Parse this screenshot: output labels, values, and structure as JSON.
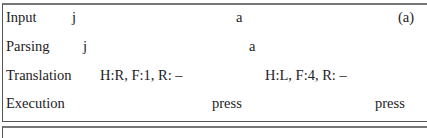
{
  "figure": {
    "panel_label": "(a)",
    "rows": [
      {
        "label": "Input",
        "cells": [
          "j",
          "a"
        ]
      },
      {
        "label": "Parsing",
        "cells": [
          "j",
          "a"
        ]
      },
      {
        "label": "Translation",
        "cells": [
          "H:R, F:1, R: –",
          "H:L, F:4, R: –"
        ]
      },
      {
        "label": "Execution",
        "cells": [
          "press",
          "press"
        ]
      }
    ]
  }
}
